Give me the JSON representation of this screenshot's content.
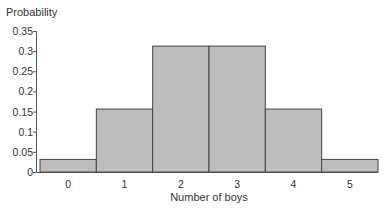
{
  "chart_data": {
    "type": "bar",
    "title": "",
    "xlabel": "Number of boys",
    "ylabel": "Probability",
    "categories": [
      "0",
      "1",
      "2",
      "3",
      "4",
      "5"
    ],
    "values": [
      0.03125,
      0.15625,
      0.3125,
      0.3125,
      0.15625,
      0.03125
    ],
    "ylim": [
      0,
      0.35
    ],
    "yticks": [
      "0",
      "0.05",
      "0.1",
      "0.15",
      "0.2",
      "0.25",
      "0.3",
      "0.35"
    ],
    "grid": false,
    "legend": null,
    "bar_color": "#bdbdbd",
    "edge_color": "#444444"
  }
}
